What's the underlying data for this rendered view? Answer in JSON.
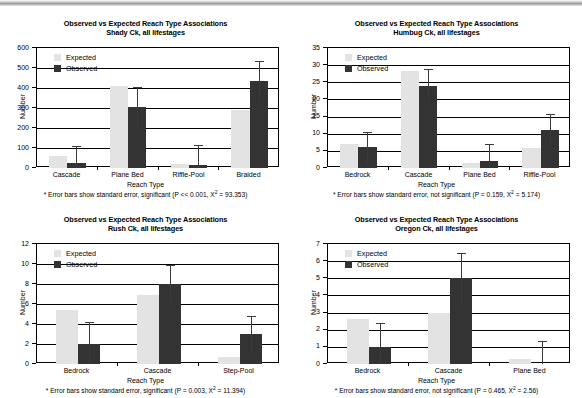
{
  "figure": {
    "panel_count": 4,
    "legend_labels": {
      "expected": "Expected",
      "observed": "Observed"
    },
    "axis_titles": {
      "x": "Reach Type",
      "y": "Number"
    }
  },
  "chart_data": [
    {
      "id": "shady-ck",
      "type": "bar",
      "title": "Observed vs Expected Reach Type Associations",
      "subtitle": "Shady Ck, all lifestages",
      "xlabel": "Reach Type",
      "ylabel": "Number",
      "ylim": [
        0,
        600
      ],
      "ytick_step": 100,
      "yticks": [
        "0",
        "100",
        "200",
        "300",
        "400",
        "500",
        "600"
      ],
      "grid": true,
      "legend_position": "top-left",
      "categories": [
        "Cascade",
        "Plane Bed",
        "Riffle-Pool",
        "Braided"
      ],
      "series": [
        {
          "name": "Expected",
          "color": "#e3e3e3",
          "values": [
            58,
            410,
            20,
            288
          ]
        },
        {
          "name": "Observed",
          "color": "#333333",
          "values": [
            25,
            305,
            17,
            435
          ]
        }
      ],
      "error_bars": [
        {
          "category": "Cascade",
          "low": 0,
          "high": 110
        },
        {
          "category": "Plane Bed",
          "low": 195,
          "high": 405
        },
        {
          "category": "Riffle-Pool",
          "low": 0,
          "high": 115
        },
        {
          "category": "Braided",
          "low": 325,
          "high": 535
        }
      ],
      "footnote": "* Error bars show standard error, significant (P << 0.001, X² = 93.353)",
      "footnote_parts": {
        "before": "* Error bars show standard error, significant (P << 0.001, X",
        "sup": "2",
        "after": " = 93.353)"
      }
    },
    {
      "id": "humbug-ck",
      "type": "bar",
      "title": "Observed vs Expected Reach Type Associations",
      "subtitle": "Humbug Ck, all lifestages",
      "xlabel": "Reach Type",
      "ylabel": "Number",
      "ylim": [
        0,
        35
      ],
      "ytick_step": 5,
      "yticks": [
        "0",
        "5",
        "10",
        "15",
        "20",
        "25",
        "30",
        "35"
      ],
      "grid": true,
      "legend_position": "top-left",
      "categories": [
        "Bedrock",
        "Cascade",
        "Plane Bed",
        "Riffle-Pool"
      ],
      "series": [
        {
          "name": "Expected",
          "color": "#e3e3e3",
          "values": [
            7.1,
            28.3,
            1.4,
            5.9
          ]
        },
        {
          "name": "Observed",
          "color": "#333333",
          "values": [
            6,
            24,
            2,
            11
          ]
        }
      ],
      "error_bars": [
        {
          "category": "Bedrock",
          "low": 1.5,
          "high": 10.5
        },
        {
          "category": "Cascade",
          "low": 19.0,
          "high": 28.8
        },
        {
          "category": "Plane Bed",
          "low": 0,
          "high": 7.0
        },
        {
          "category": "Riffle-Pool",
          "low": 6.5,
          "high": 15.7
        }
      ],
      "footnote": "* Error bars show standard error, not significant (P = 0.159, X² = 5.174)",
      "footnote_parts": {
        "before": "* Error bars show standard error, not significant (P = 0.159, X",
        "sup": "2",
        "after": " = 5.174)"
      }
    },
    {
      "id": "rush-ck",
      "type": "bar",
      "title": "Observed vs Expected Reach Type Associations",
      "subtitle": "Rush Ck, all lifestages",
      "xlabel": "Reach Type",
      "ylabel": "Number",
      "ylim": [
        0,
        12
      ],
      "ytick_step": 2,
      "yticks": [
        "0",
        "2",
        "4",
        "6",
        "8",
        "10",
        "12"
      ],
      "grid": true,
      "legend_position": "top-left",
      "categories": [
        "Bedrock",
        "Cascade",
        "Step-Pool"
      ],
      "series": [
        {
          "name": "Expected",
          "color": "#e3e3e3",
          "values": [
            5.4,
            6.9,
            0.7
          ]
        },
        {
          "name": "Observed",
          "color": "#333333",
          "values": [
            2,
            8,
            3
          ]
        }
      ],
      "error_bars": [
        {
          "category": "Bedrock",
          "low": 0,
          "high": 4.2
        },
        {
          "category": "Cascade",
          "low": 6.1,
          "high": 9.9
        },
        {
          "category": "Step-Pool",
          "low": 1.2,
          "high": 4.8
        }
      ],
      "footnote": "* Error bars show standard error, significant (P = 0.003, X² = 11.394)",
      "footnote_parts": {
        "before": "* Error bars show standard error, significant (P = 0.003, X",
        "sup": "2",
        "after": " = 11.394)"
      }
    },
    {
      "id": "oregon-ck",
      "type": "bar",
      "title": "Observed vs Expected Reach Type Associations",
      "subtitle": "Oregon Ck, all lifestages",
      "xlabel": "Reach Type",
      "ylabel": "Number",
      "ylim": [
        0,
        7
      ],
      "ytick_step": 1,
      "yticks": [
        "0",
        "1",
        "2",
        "3",
        "4",
        "5",
        "6",
        "7"
      ],
      "grid": true,
      "legend_position": "top-left",
      "categories": [
        "Bedrock",
        "Cascade",
        "Plane Bed"
      ],
      "series": [
        {
          "name": "Expected",
          "color": "#e3e3e3",
          "values": [
            2.6,
            3.0,
            0.3
          ]
        },
        {
          "name": "Observed",
          "color": "#333333",
          "values": [
            1,
            5,
            0
          ]
        }
      ],
      "error_bars": [
        {
          "category": "Bedrock",
          "low": 0,
          "high": 2.4
        },
        {
          "category": "Cascade",
          "low": 3.4,
          "high": 6.5
        },
        {
          "category": "Plane Bed",
          "low": 0,
          "high": 1.35
        }
      ],
      "footnote": "* Error bars show standard error, not significant (P = 0.465, X² = 2.56)",
      "footnote_parts": {
        "before": "* Error bars show standard error, not significant (P = 0.465, X",
        "sup": "2",
        "after": " = 2.56)"
      }
    }
  ]
}
